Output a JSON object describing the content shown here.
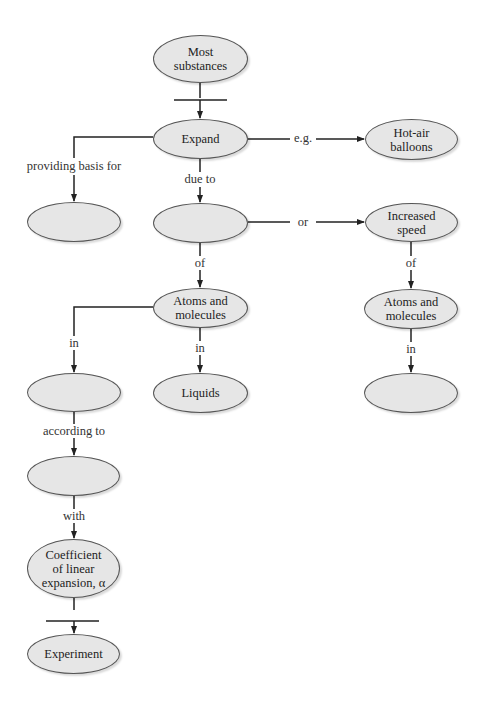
{
  "nodes": {
    "most_substances": "Most\nsubstances",
    "expand": "Expand",
    "hot_air_balloons": "Hot-air\nballoons",
    "blank_providing": "",
    "blank_due_to": "",
    "increased_speed": "Increased\nspeed",
    "atoms_molecules_mid": "Atoms and\nmolecules",
    "atoms_molecules_right": "Atoms and\nmolecules",
    "blank_in_left": "",
    "liquids": "Liquids",
    "blank_in_right": "",
    "blank_according_to": "",
    "coefficient": "Coefficient\nof linear\nexpansion, α",
    "experiment": "Experiment"
  },
  "links": {
    "eg": "e.g.",
    "providing_basis_for": "providing basis for",
    "due_to": "due to",
    "or": "or",
    "of_mid": "of",
    "of_right": "of",
    "in_left": "in",
    "in_mid": "in",
    "in_right": "in",
    "according_to": "according to",
    "with": "with"
  },
  "colors": {
    "node_fill": "#e6e6e6",
    "line": "#222222"
  }
}
